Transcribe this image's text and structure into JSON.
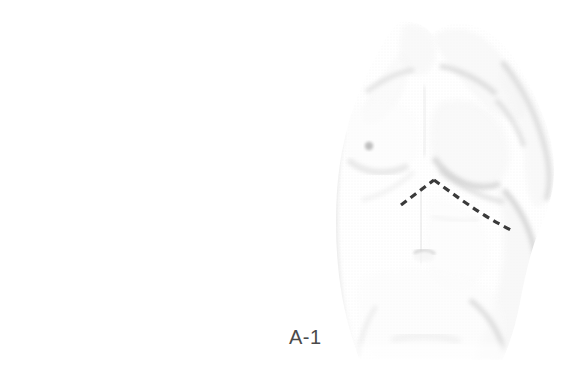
{
  "figure": {
    "label": "A-1",
    "caption_text": "A-1",
    "view": "anterior",
    "illustration_style": "halftone-screened-line-drawing",
    "background_color": "#ffffff",
    "label_color": "#4a4a4a",
    "label_font_size_px": 20,
    "figure_bounds": {
      "x": 330,
      "y": 25,
      "width": 230,
      "height": 335
    }
  },
  "markings": {
    "incision_line": {
      "name": "chevron-incision-line",
      "style": "dashed",
      "color": "#3a3a3a",
      "stroke_width_px": 3,
      "dash_length_px": 7,
      "gap_length_px": 5,
      "apex": {
        "x": 434,
        "y": 180
      },
      "left_end": {
        "x": 401,
        "y": 205
      },
      "right_end": {
        "x": 513,
        "y": 231
      },
      "description": "Inverted-V subcostal chevron incision marking across upper abdomen"
    },
    "nipple_dot": {
      "name": "nipple-marker",
      "color": "#b8b8b8",
      "center": {
        "x": 369,
        "y": 146
      },
      "radius_px": 4
    }
  },
  "anatomy_shading": {
    "tone_light": "#f4f4f4",
    "tone_mid": "#ededed",
    "tone_dark": "#e2e2e2",
    "tone_edge": "#d8d8d8",
    "regions": [
      "neck",
      "left-clavicle",
      "right-clavicle",
      "left-pectoral",
      "right-pectoral",
      "right-arm",
      "left-flank",
      "right-flank",
      "linea-alba",
      "umbilicus",
      "rectus-abdominis",
      "iliac-crest",
      "lower-abdomen"
    ]
  }
}
